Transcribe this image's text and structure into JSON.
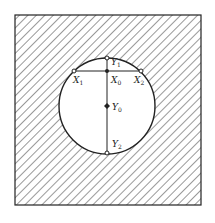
{
  "diagram": {
    "points": {
      "Y1": {
        "label": "Y",
        "sub": "1"
      },
      "X0": {
        "label": "X",
        "sub": "0"
      },
      "X1": {
        "label": "X",
        "sub": "1"
      },
      "X2": {
        "label": "X",
        "sub": "2"
      },
      "Y0": {
        "label": "Y",
        "sub": "0"
      },
      "Y2": {
        "label": "Y",
        "sub": "2"
      }
    },
    "colors": {
      "stroke": "#222222",
      "hatch": "#333333",
      "background": "#ffffff"
    }
  }
}
